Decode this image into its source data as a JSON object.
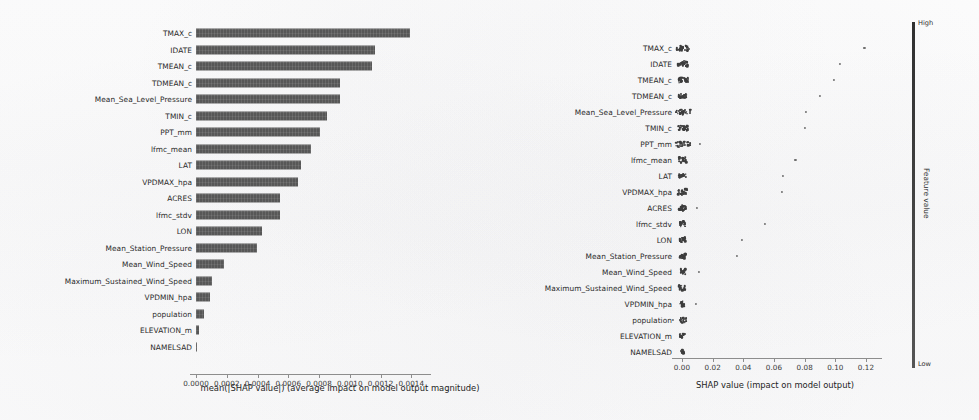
{
  "chart_data": [
    {
      "id": "bar",
      "type": "bar",
      "orientation": "horizontal",
      "title": "",
      "xlabel": "mean(|SHAP value|) (average impact on model output magnitude)",
      "ylabel": "",
      "xlim": [
        0.0,
        0.00145
      ],
      "grid": false,
      "legend": "none",
      "bar_color": "#575757",
      "xticks": [
        "0.0000",
        "0.0002",
        "0.0004",
        "0.0006",
        "0.0008",
        "0.0010",
        "0.0012",
        "0.0014"
      ],
      "xtick_values": [
        0.0,
        0.0002,
        0.0004,
        0.0006,
        0.0008,
        0.001,
        0.0012,
        0.0014
      ],
      "categories": [
        "TMAX_c",
        "IDATE",
        "TMEAN_c",
        "TDMEAN_c",
        "Mean_Sea_Level_Pressure",
        "TMIN_c",
        "PPT_mm",
        "lfmc_mean",
        "LAT",
        "VPDMAX_hpa",
        "ACRES",
        "lfmc_stdv",
        "LON",
        "Mean_Station_Pressure",
        "Mean_Wind_Speed",
        "Maximum_Sustained_Wind_Speed",
        "VPDMIN_hpa",
        "population",
        "ELEVATION_m",
        "NAMELSAD"
      ],
      "values": [
        0.00139,
        0.001165,
        0.001145,
        0.000935,
        0.000935,
        0.000855,
        0.000805,
        0.000745,
        0.000685,
        0.000665,
        0.000545,
        0.000545,
        0.00043,
        0.000395,
        0.00018,
        0.000105,
        9e-05,
        5.5e-05,
        2.2e-05,
        4e-06
      ]
    },
    {
      "id": "beeswarm",
      "type": "scatter",
      "title": "",
      "xlabel": "SHAP value (impact on model output)",
      "ylabel": "",
      "xlim": [
        -0.008,
        0.132
      ],
      "grid": false,
      "legend": "colorbar",
      "xticks": [
        "0.00",
        "0.02",
        "0.04",
        "0.06",
        "0.08",
        "0.10",
        "0.12"
      ],
      "xtick_values": [
        0.0,
        0.02,
        0.04,
        0.06,
        0.08,
        0.1,
        0.12
      ],
      "categories": [
        "TMAX_c",
        "IDATE",
        "TMEAN_c",
        "TDMEAN_c",
        "Mean_Sea_Level_Pressure",
        "TMIN_c",
        "PPT_mm",
        "lfmc_mean",
        "LAT",
        "VPDMAX_hpa",
        "ACRES",
        "lfmc_stdv",
        "LON",
        "Mean_Station_Pressure",
        "Mean_Wind_Speed",
        "Maximum_Sustained_Wind_Speed",
        "VPDMIN_hpa",
        "population",
        "ELEVATION_m",
        "NAMELSAD"
      ],
      "rows": [
        {
          "feature": "TMAX_c",
          "outlier": 0.119,
          "spread": 0.0035,
          "n": 26
        },
        {
          "feature": "IDATE",
          "outlier": 0.103,
          "spread": 0.003,
          "n": 28
        },
        {
          "feature": "TMEAN_c",
          "outlier": 0.099,
          "spread": 0.0032,
          "n": 28
        },
        {
          "feature": "TDMEAN_c",
          "outlier": 0.09,
          "spread": 0.0022,
          "n": 24
        },
        {
          "feature": "Mean_Sea_Level_Pressure",
          "outlier": 0.081,
          "spread": 0.004,
          "n": 24
        },
        {
          "feature": "TMIN_c",
          "outlier": 0.08,
          "spread": 0.003,
          "n": 24
        },
        {
          "feature": "PPT_mm",
          "outlier": 0.012,
          "spread": 0.0042,
          "n": 22
        },
        {
          "feature": "lfmc_mean",
          "outlier": 0.074,
          "spread": 0.002,
          "n": 22
        },
        {
          "feature": "LAT",
          "outlier": 0.066,
          "spread": 0.002,
          "n": 22
        },
        {
          "feature": "VPDMAX_hpa",
          "outlier": 0.065,
          "spread": 0.0024,
          "n": 22
        },
        {
          "feature": "ACRES",
          "outlier": 0.01,
          "spread": 0.0018,
          "n": 20
        },
        {
          "feature": "lfmc_stdv",
          "outlier": 0.054,
          "spread": 0.0016,
          "n": 20
        },
        {
          "feature": "LON",
          "outlier": 0.039,
          "spread": 0.0016,
          "n": 20
        },
        {
          "feature": "Mean_Station_Pressure",
          "outlier": 0.036,
          "spread": 0.0018,
          "n": 20
        },
        {
          "feature": "Mean_Wind_Speed",
          "outlier": 0.011,
          "spread": 0.0016,
          "n": 18
        },
        {
          "feature": "Maximum_Sustained_Wind_Speed",
          "outlier": null,
          "spread": 0.002,
          "n": 18
        },
        {
          "feature": "VPDMIN_hpa",
          "outlier": 0.009,
          "spread": 0.0014,
          "n": 18
        },
        {
          "feature": "population",
          "outlier": -0.006,
          "spread": 0.0022,
          "n": 18
        },
        {
          "feature": "ELEVATION_m",
          "outlier": null,
          "spread": 0.0016,
          "n": 16
        },
        {
          "feature": "NAMELSAD",
          "outlier": null,
          "spread": 0.001,
          "n": 14
        }
      ],
      "colorbar": {
        "high_label": "High",
        "low_label": "Low",
        "title": "Feature value"
      }
    }
  ]
}
